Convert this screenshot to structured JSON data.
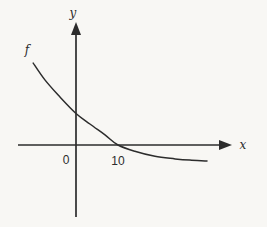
{
  "page": {
    "background": "#f8f7f4",
    "ink": "#2c2c2c"
  },
  "chart_data": {
    "type": "line",
    "title": "",
    "xlabel": "x",
    "ylabel": "y",
    "grid": false,
    "legend": "none",
    "axes_style": "centered-cross-with-arrowheads",
    "xlim": [
      -14,
      37
    ],
    "ylim": [
      -17,
      29
    ],
    "x_ticks": [
      {
        "value": 0,
        "label": "0"
      },
      {
        "value": 10,
        "label": "10"
      }
    ],
    "y_ticks": [],
    "series": [
      {
        "name": "f",
        "shape": "decreasing-convex-curve",
        "x_intercept": 10,
        "y_intercept": 7.5,
        "horizontal_asymptote": -4,
        "points": [
          [
            -10.2,
            19.5
          ],
          [
            -7.4,
            15.5
          ],
          [
            -3.8,
            11.4
          ],
          [
            0,
            7.5
          ],
          [
            3.3,
            5.0
          ],
          [
            6.9,
            2.4
          ],
          [
            10,
            0
          ],
          [
            14,
            -1.5
          ],
          [
            18.8,
            -2.7
          ],
          [
            23.6,
            -3.3
          ],
          [
            27.1,
            -3.6
          ],
          [
            31.2,
            -3.8
          ]
        ]
      }
    ]
  }
}
